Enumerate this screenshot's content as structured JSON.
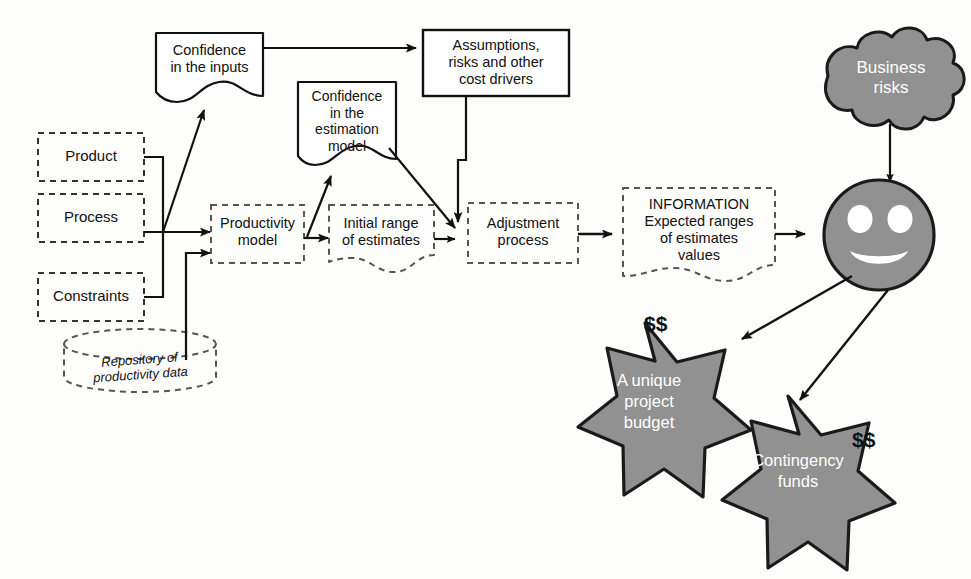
{
  "diagram": {
    "colors": {
      "shape_fill_gray": "#919191",
      "shape_stroke": "#1a1a1a",
      "line": "#111111",
      "white_text": "#ffffff",
      "dark_text": "#111111",
      "background": "#fdfdfc"
    }
  },
  "inputs": [
    {
      "id": "product",
      "label": "Product",
      "shape": "dashed-rect"
    },
    {
      "id": "process",
      "label": "Process",
      "shape": "dashed-rect"
    },
    {
      "id": "constraints",
      "label": "Constraints",
      "shape": "dashed-rect"
    }
  ],
  "repository": {
    "label_line1": "Repository of",
    "label_line2": "productivity data",
    "shape": "dashed-cylinder"
  },
  "confidence_inputs": {
    "label_line1": "Confidence",
    "label_line2": "in the inputs",
    "shape": "document"
  },
  "confidence_model": {
    "label_line1": "Confidence",
    "label_line2": "in the",
    "label_line3": "estimation",
    "label_line4": "model",
    "shape": "document"
  },
  "assumptions": {
    "label_line1": "Assumptions,",
    "label_line2": "risks and other",
    "label_line3": "cost drivers",
    "shape": "solid-rect"
  },
  "productivity_model": {
    "label_line1": "Productivity",
    "label_line2": "model",
    "shape": "dashed-rect"
  },
  "initial_range": {
    "label_line1": "Initial range",
    "label_line2": "of estimates",
    "shape": "dashed-document"
  },
  "adjustment": {
    "label_line1": "Adjustment",
    "label_line2": "process",
    "shape": "dashed-rect"
  },
  "information": {
    "label_line1": "INFORMATION",
    "label_line2": "Expected ranges",
    "label_line3": "of estimates",
    "label_line4": "values",
    "shape": "dashed-document"
  },
  "business_risks": {
    "label_line1": "Business",
    "label_line2": "risks",
    "shape": "cloud"
  },
  "estimator": {
    "label": "smiley face",
    "shape": "circle-smiley"
  },
  "budget_star": {
    "label_line1": "A unique",
    "label_line2": "project",
    "label_line3": "budget",
    "money": "$$",
    "shape": "7-point-star"
  },
  "contingency_star": {
    "label_line1": "Contingency",
    "label_line2": "funds",
    "money": "$$",
    "shape": "7-point-star"
  },
  "connections": [
    {
      "from": "product",
      "to": "productivity-model"
    },
    {
      "from": "process",
      "to": "productivity-model"
    },
    {
      "from": "constraints",
      "to": "productivity-model"
    },
    {
      "from": "repository",
      "to": "productivity-model"
    },
    {
      "from": "process",
      "to": "confidence-inputs"
    },
    {
      "from": "productivity-model",
      "to": "confidence-model"
    },
    {
      "from": "productivity-model",
      "to": "initial-range"
    },
    {
      "from": "confidence-inputs",
      "to": "assumptions"
    },
    {
      "from": "assumptions",
      "to": "adjustment-process"
    },
    {
      "from": "confidence-model",
      "to": "adjustment-process"
    },
    {
      "from": "initial-range",
      "to": "adjustment-process"
    },
    {
      "from": "adjustment-process",
      "to": "information"
    },
    {
      "from": "information",
      "to": "estimator"
    },
    {
      "from": "business-risks",
      "to": "estimator"
    },
    {
      "from": "estimator",
      "to": "budget-star"
    },
    {
      "from": "estimator",
      "to": "contingency-star"
    }
  ]
}
